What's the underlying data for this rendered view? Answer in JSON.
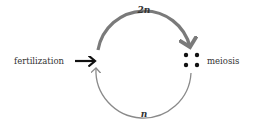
{
  "diagram": {
    "top_label": "2n",
    "bottom_label": "n",
    "left_label": "fertilization",
    "right_label": "meiosis",
    "colors": {
      "top_arc": "#7a7a7a",
      "bottom_arc": "#8a8a8a",
      "input_arrow": "#111111",
      "dots": "#111111",
      "text": "#333333"
    }
  }
}
